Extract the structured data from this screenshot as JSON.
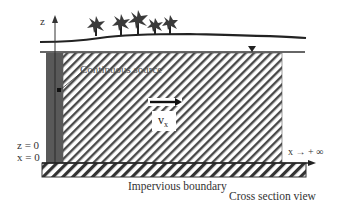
{
  "diagram": {
    "type": "cross-section-schematic",
    "title": "Cross section view",
    "axes": {
      "vertical_label": "z",
      "origin_labels": [
        "z = 0",
        "x = 0"
      ],
      "horizontal_label": "x → + ∞"
    },
    "elements": {
      "source_label": "Continuous source",
      "velocity_label": "v",
      "velocity_subscript": "x",
      "boundary_label": "Impervious boundary",
      "view_label": "Cross section view"
    },
    "trees_count": 5,
    "colors": {
      "line": "#222222",
      "hatch": "#444444",
      "source_fill": "#555555",
      "text": "#333333",
      "background": "#ffffff"
    }
  }
}
